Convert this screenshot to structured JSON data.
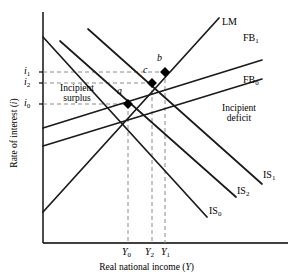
{
  "chart_data": {
    "type": "line",
    "title": "",
    "xlabel": "Real national income (Y)",
    "ylabel": "Rate of interest (i)",
    "grid": false,
    "legend": "inline-curve-labels",
    "axis_origin": {
      "x": 43,
      "y": 243
    },
    "axis_extent": {
      "x_max": 288,
      "y_min": 12
    },
    "y_ticks": [
      {
        "label": "i",
        "sub": "1",
        "value": "i1",
        "y": 72
      },
      {
        "label": "i",
        "sub": "2",
        "value": "i2",
        "y": 83
      },
      {
        "label": "i",
        "sub": "0",
        "value": "i0",
        "y": 104
      }
    ],
    "x_ticks": [
      {
        "label": "Y",
        "sub": "0",
        "value": "Y0",
        "x": 128
      },
      {
        "label": "Y",
        "sub": "2",
        "value": "Y2",
        "x": 152
      },
      {
        "label": "Y",
        "sub": "1",
        "value": "Y1",
        "x": 165
      }
    ],
    "curves": [
      {
        "name": "LM",
        "label": "LM",
        "sub": "",
        "slope": "upward-steep",
        "x1": 43,
        "y1": 212,
        "x2": 219,
        "y2": 18,
        "label_x": 222,
        "label_y": 22
      },
      {
        "name": "FB1",
        "label": "FB",
        "sub": "1",
        "slope": "upward-shallow",
        "x1": 43,
        "y1": 128,
        "x2": 262,
        "y2": 60,
        "label_x": 243,
        "label_y": 40
      },
      {
        "name": "FB0",
        "label": "FB",
        "sub": "0",
        "slope": "upward-shallow",
        "x1": 43,
        "y1": 146,
        "x2": 262,
        "y2": 79,
        "label_x": 243,
        "label_y": 82
      },
      {
        "name": "IS1",
        "label": "IS",
        "sub": "1",
        "slope": "downward",
        "x1": 88,
        "y1": 29,
        "x2": 262,
        "y2": 184,
        "label_x": 264,
        "label_y": 177
      },
      {
        "name": "IS2",
        "label": "IS",
        "sub": "2",
        "slope": "downward",
        "x1": 60,
        "y1": 41,
        "x2": 236,
        "y2": 197,
        "label_x": 238,
        "label_y": 192
      },
      {
        "name": "IS0",
        "label": "IS",
        "sub": "0",
        "slope": "downward",
        "x1": 43,
        "y1": 37,
        "x2": 207,
        "y2": 217,
        "label_x": 210,
        "label_y": 212
      }
    ],
    "points": [
      {
        "name": "a",
        "label": "a",
        "x": 128,
        "y": 104,
        "label_x": 118,
        "label_y": 92
      },
      {
        "name": "b",
        "label": "b",
        "x": 165,
        "y": 72,
        "label_x": 157,
        "label_y": 58
      },
      {
        "name": "c",
        "label": "c",
        "x": 152,
        "y": 83,
        "label_x": 143,
        "label_y": 70
      }
    ],
    "annotations": [
      {
        "name": "incipient-surplus",
        "line1": "Incipient",
        "line2": "surplus",
        "x": 48,
        "y": 86
      },
      {
        "name": "incipient-deficit",
        "line1": "Incipient",
        "line2": "deficit",
        "x": 212,
        "y": 105
      }
    ],
    "dashed_guides": {
      "color": "#888888",
      "horizontal": [
        {
          "from_y_tick": "i1",
          "y": 72,
          "x_end": 165
        },
        {
          "from_y_tick": "i2",
          "y": 83,
          "x_end": 152
        },
        {
          "from_y_tick": "i0",
          "y": 104,
          "x_end": 128
        }
      ],
      "vertical": [
        {
          "from_x_tick": "Y0",
          "x": 128,
          "y_start": 104
        },
        {
          "from_x_tick": "Y2",
          "x": 152,
          "y_start": 83
        },
        {
          "from_x_tick": "Y1",
          "x": 165,
          "y_start": 72
        }
      ]
    },
    "colors": {
      "axis": "#000000",
      "curve": "#1a1a1a",
      "dash": "#8a8a8a",
      "point": "#000000"
    }
  }
}
